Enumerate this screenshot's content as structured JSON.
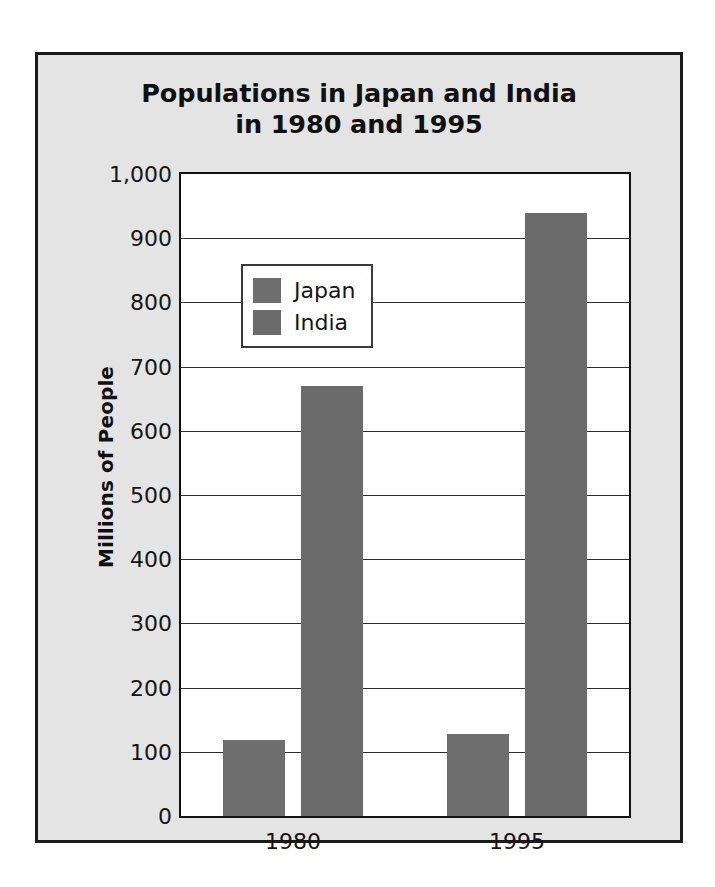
{
  "chart_data": {
    "type": "bar",
    "title": "Populations in Japan and India in 1980 and 1995",
    "title_lines": [
      "Populations in Japan and India",
      "in 1980 and 1995"
    ],
    "categories": [
      "1980",
      "1995"
    ],
    "series": [
      {
        "name": "Japan",
        "values": [
          118,
          128
        ],
        "color": "#6e6e6e"
      },
      {
        "name": "India",
        "values": [
          670,
          940
        ],
        "color": "#6b6b6b"
      }
    ],
    "xlabel": "",
    "ylabel": "Millions of People",
    "ylim": [
      0,
      1000
    ],
    "ytick_step": 100,
    "ytick_labels": [
      "1,000",
      "900",
      "800",
      "700",
      "600",
      "500",
      "400",
      "300",
      "200",
      "100",
      "0"
    ],
    "ytick_values": [
      1000,
      900,
      800,
      700,
      600,
      500,
      400,
      300,
      200,
      100,
      0
    ],
    "grid": true,
    "legend_position": "upper-left-inside",
    "legend_entries": [
      "Japan",
      "India"
    ],
    "background_color": "#e4e4e4",
    "plot_background_color": "#ffffff",
    "frame_color": "#1a1a1a"
  }
}
